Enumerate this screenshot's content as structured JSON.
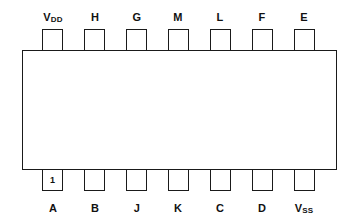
{
  "diagram": {
    "colors": {
      "stroke": "#1a1a1a",
      "background": "#ffffff",
      "text": "#111111"
    },
    "pin1_marker": "1",
    "top_pins": [
      {
        "label": "V",
        "sub": "DD"
      },
      {
        "label": "H",
        "sub": ""
      },
      {
        "label": "G",
        "sub": ""
      },
      {
        "label": "M",
        "sub": ""
      },
      {
        "label": "L",
        "sub": ""
      },
      {
        "label": "F",
        "sub": ""
      },
      {
        "label": "E",
        "sub": ""
      }
    ],
    "bottom_pins": [
      {
        "label": "A",
        "sub": ""
      },
      {
        "label": "B",
        "sub": ""
      },
      {
        "label": "J",
        "sub": ""
      },
      {
        "label": "K",
        "sub": ""
      },
      {
        "label": "C",
        "sub": ""
      },
      {
        "label": "D",
        "sub": ""
      },
      {
        "label": "V",
        "sub": "SS"
      }
    ]
  }
}
